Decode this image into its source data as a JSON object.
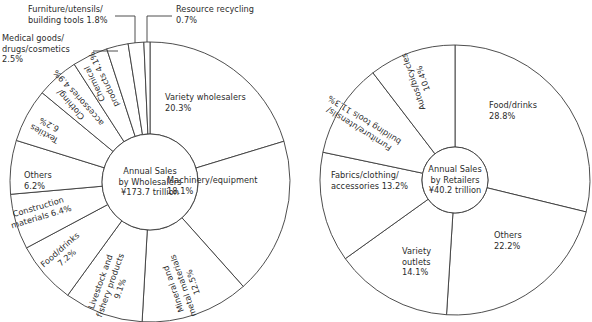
{
  "figure": {
    "background": "#ffffff",
    "line_color": "#3a3a3a",
    "text_color": "#2b2b2b"
  },
  "chart_data": [
    {
      "type": "pie",
      "name": "wholesalers",
      "title": "Annual Sales by Wholesalers ¥173.7 trillion",
      "center_lines": [
        "Annual Sales",
        "by Wholesalers",
        "¥173.7 trillion"
      ],
      "total_label": "¥173.7 trillion",
      "units": "percent",
      "start_angle_deg": 0,
      "direction": "clockwise",
      "categories": [
        "Variety wholesalers",
        "Machinery/equipment",
        "Mineral and metal materials",
        "Livestock and fishery products",
        "Food/drinks",
        "Construction materials",
        "Others",
        "Textiles",
        "Clothing/accessories",
        "Chemical products",
        "Medical goods/drugs/cosmetics",
        "Furniture/utensils/building tools",
        "Resource recycling"
      ],
      "values": [
        20.3,
        18.1,
        12.5,
        9.1,
        7.2,
        6.4,
        6.2,
        6.2,
        4.9,
        4.1,
        2.5,
        1.8,
        0.7
      ],
      "slices": [
        {
          "label": "Variety wholesalers",
          "value": 20.3,
          "value_text": "20.3%",
          "lines": [
            "Variety wholesalers",
            "20.3%"
          ],
          "style": "horizontal"
        },
        {
          "label": "Machinery/equipment",
          "value": 18.1,
          "value_text": "18.1%",
          "lines": [
            "Machinery/equipment",
            "18.1%"
          ],
          "style": "horizontal"
        },
        {
          "label": "Mineral and metal materials",
          "value": 12.5,
          "value_text": "12.5%",
          "lines": [
            "Mineral and",
            "metal materials",
            "12.5%"
          ],
          "style": "radial"
        },
        {
          "label": "Livestock and fishery products",
          "value": 9.1,
          "value_text": "9.1%",
          "lines": [
            "Livestock and",
            "fishery products",
            "9.1%"
          ],
          "style": "radial"
        },
        {
          "label": "Food/drinks",
          "value": 7.2,
          "value_text": "7.2%",
          "lines": [
            "Food/drinks",
            "7.2%"
          ],
          "style": "radial"
        },
        {
          "label": "Construction materials",
          "value": 6.4,
          "value_text": "6.4%",
          "lines": [
            "Construction",
            "materials 6.4%"
          ],
          "style": "radial"
        },
        {
          "label": "Others",
          "value": 6.2,
          "value_text": "6.2%",
          "lines": [
            "Others",
            "6.2%"
          ],
          "style": "horizontal"
        },
        {
          "label": "Textiles",
          "value": 6.2,
          "value_text": "6.2%",
          "lines": [
            "Textiles",
            "6.2%"
          ],
          "style": "radial"
        },
        {
          "label": "Clothing/accessories",
          "value": 4.9,
          "value_text": "4.9%",
          "lines": [
            "Clothing/",
            "accessories 4.9%"
          ],
          "style": "radial"
        },
        {
          "label": "Chemical products",
          "value": 4.1,
          "value_text": "4.1%",
          "lines": [
            "Chemical",
            "products 4.1%"
          ],
          "style": "radial"
        },
        {
          "label": "Medical goods/drugs/cosmetics",
          "value": 2.5,
          "value_text": "2.5%",
          "lines": [
            "Medical goods/",
            "drugs/cosmetics",
            "2.5%"
          ],
          "style": "callout"
        },
        {
          "label": "Furniture/utensils/building tools",
          "value": 1.8,
          "value_text": "1.8%",
          "lines": [
            "Furniture/utensils/",
            "building tools 1.8%"
          ],
          "style": "callout"
        },
        {
          "label": "Resource recycling",
          "value": 0.7,
          "value_text": "0.7%",
          "lines": [
            "Resource recycling",
            "0.7%"
          ],
          "style": "callout"
        }
      ]
    },
    {
      "type": "pie",
      "name": "retailers",
      "title": "Annual Sales by Retailers ¥40.2 trillion",
      "center_lines": [
        "Annual Sales",
        "by Retailers",
        "¥40.2 trillion"
      ],
      "total_label": "¥40.2 trillion",
      "units": "percent",
      "start_angle_deg": 0,
      "direction": "clockwise",
      "categories": [
        "Food/drinks",
        "Others",
        "Variety outlets",
        "Fabrics/clothing/accessories",
        "Furniture/utensils/building tools",
        "Autos/bicycles"
      ],
      "values": [
        28.8,
        22.2,
        14.1,
        13.2,
        11.3,
        10.4
      ],
      "slices": [
        {
          "label": "Food/drinks",
          "value": 28.8,
          "value_text": "28.8%",
          "lines": [
            "Food/drinks",
            "28.8%"
          ],
          "style": "horizontal"
        },
        {
          "label": "Others",
          "value": 22.2,
          "value_text": "22.2%",
          "lines": [
            "Others",
            "22.2%"
          ],
          "style": "horizontal"
        },
        {
          "label": "Variety outlets",
          "value": 14.1,
          "value_text": "14.1%",
          "lines": [
            "Variety",
            "outlets",
            "14.1%"
          ],
          "style": "horizontal"
        },
        {
          "label": "Fabrics/clothing/accessories",
          "value": 13.2,
          "value_text": "13.2%",
          "lines": [
            "Fabrics/clothing/",
            "accessories 13.2%"
          ],
          "style": "horizontal"
        },
        {
          "label": "Furniture/utensils/building tools",
          "value": 11.3,
          "value_text": "11.3%",
          "lines": [
            "Furniture/utensils/",
            "building tools 11.3%"
          ],
          "style": "radial"
        },
        {
          "label": "Autos/bicycles",
          "value": 10.4,
          "value_text": "10.4%",
          "lines": [
            "Autos/bicycles",
            "10.4%"
          ],
          "style": "radial"
        }
      ]
    }
  ]
}
